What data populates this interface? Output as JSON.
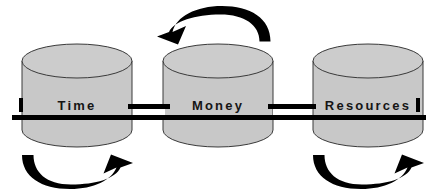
{
  "diagram": {
    "background_color": "#ffffff",
    "cylinder_fill": "#c8c8c8",
    "cylinder_top_fill": "#cccccc",
    "cylinder_stroke": "#3a3a3a",
    "bar_color": "#000000",
    "arrow_color": "#000000",
    "label_color": "#151515",
    "nodes": [
      {
        "id": "time",
        "label": "Time",
        "cx": 77,
        "cy": 100,
        "rx": 55,
        "top_ry": 17,
        "body_height": 78,
        "label_x": 77,
        "label_y": 107
      },
      {
        "id": "money",
        "label": "Money",
        "cx": 218,
        "cy": 100,
        "rx": 55,
        "top_ry": 17,
        "body_height": 78,
        "label_x": 218,
        "label_y": 107
      },
      {
        "id": "resources",
        "label": "Resources",
        "cx": 368,
        "cy": 100,
        "rx": 55,
        "top_ry": 17,
        "body_height": 78,
        "label_x": 368,
        "label_y": 107
      }
    ],
    "connector_bars": [
      {
        "id": "main-bar",
        "orientation": "horizontal",
        "x": 12,
        "y": 115,
        "width": 414,
        "height": 5
      },
      {
        "id": "upper-link-bar-left",
        "orientation": "horizontal",
        "x": 128,
        "y": 104,
        "width": 42,
        "height": 5
      },
      {
        "id": "upper-link-bar-right",
        "orientation": "horizontal",
        "x": 268,
        "y": 104,
        "width": 48,
        "height": 5
      }
    ],
    "end_caps": [
      {
        "id": "left-cap",
        "x": 19,
        "y": 98,
        "width": 4,
        "height": 14
      },
      {
        "id": "right-cap",
        "x": 416,
        "y": 98,
        "width": 4,
        "height": 14
      }
    ],
    "arrows": [
      {
        "id": "top-arrow",
        "label": "counterclockwise arc arrow above Money",
        "direction": "leftward",
        "position": "top-center"
      },
      {
        "id": "bottom-left-arrow",
        "label": "clockwise arc arrow below Time",
        "direction": "rightward",
        "position": "bottom-left"
      },
      {
        "id": "bottom-right-arrow",
        "label": "clockwise arc arrow below Resources",
        "direction": "rightward",
        "position": "bottom-right"
      }
    ]
  }
}
